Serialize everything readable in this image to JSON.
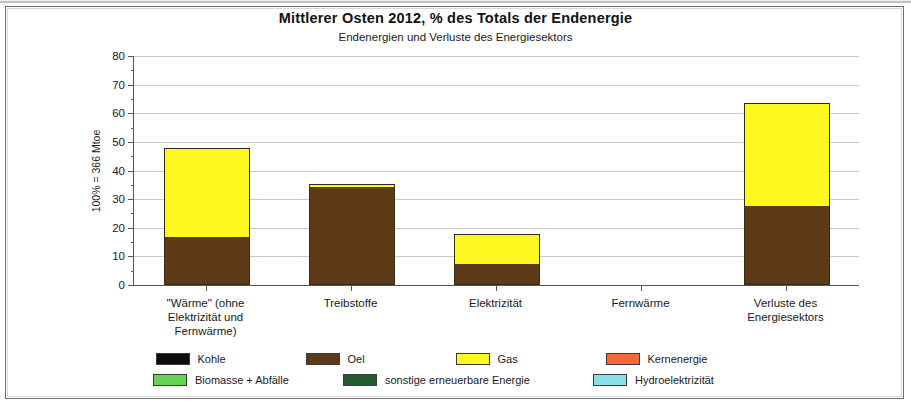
{
  "chart_data": {
    "type": "bar",
    "stacked": true,
    "title": "Mittlerer Osten  2012,  % des Totals der Endenergie",
    "subtitle": "Endenergien und Verluste des Energiesektors",
    "xlabel": "",
    "ylabel": "100% = 366 Mtoe",
    "ylim": [
      0,
      80
    ],
    "ytick_step": 10,
    "yticks": [
      "0",
      "10",
      "20",
      "30",
      "40",
      "50",
      "60",
      "70",
      "80"
    ],
    "grid": true,
    "legend_position": "bottom",
    "categories": [
      "\"Wärme\" (ohne Elektrizität und Fernwärme)",
      "Treibstoffe",
      "Elektrizität",
      "Fernwärme",
      "Verluste des Energiesektors"
    ],
    "category_lines": [
      [
        "\"Wärme\" (ohne",
        "Elektrizität und",
        "Fernwärme)"
      ],
      [
        "Treibstoffe"
      ],
      [
        "Elektrizität"
      ],
      [
        "Fernwärme"
      ],
      [
        "Verluste des",
        "Energiesektors"
      ]
    ],
    "series": [
      {
        "name": "Kohle",
        "color": "#0d0d0d",
        "values": [
          0.4,
          0.2,
          0.4,
          0,
          0.5
        ]
      },
      {
        "name": "Oel",
        "color": "#5c3a17",
        "values": [
          16.5,
          34.0,
          7.0,
          0,
          27.0
        ]
      },
      {
        "name": "Gas",
        "color": "#fff820",
        "values": [
          31.1,
          0.8,
          10.4,
          0,
          36.0
        ]
      },
      {
        "name": "Kernenergie",
        "color": "#f4663c",
        "values": [
          0,
          0,
          0,
          0,
          0
        ]
      },
      {
        "name": "Biomasse + Abfälle",
        "color": "#66d452",
        "values": [
          0,
          0,
          0,
          0,
          0
        ]
      },
      {
        "name": "sonstige erneuerbare Energie",
        "color": "#1f5c2a",
        "values": [
          0,
          0,
          0,
          0,
          0
        ]
      },
      {
        "name": "Hydroelektrizität",
        "color": "#87e0e8",
        "values": [
          0,
          0,
          0,
          0,
          0
        ]
      }
    ],
    "totals": [
      48.0,
      35.0,
      17.8,
      0.0,
      63.5
    ]
  },
  "legend": {
    "row1": [
      "Kohle",
      "Oel",
      "Gas",
      "Kernenergie"
    ],
    "row2": [
      "Biomasse + Abfälle",
      "sonstige erneuerbare Energie",
      "Hydroelektrizität"
    ]
  }
}
